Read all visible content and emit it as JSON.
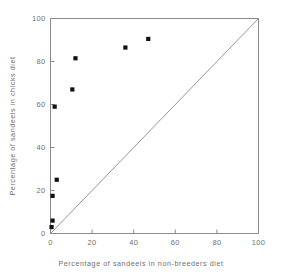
{
  "chart_data": {
    "type": "scatter",
    "title": "",
    "xlabel": "Percentage of sandeels in non-breeders diet",
    "ylabel": "Percentage of sandeels in chicks diet",
    "xlim": [
      0,
      100
    ],
    "ylim": [
      0,
      100
    ],
    "xticks": [
      0,
      20,
      40,
      60,
      80,
      100
    ],
    "yticks": [
      0,
      20,
      40,
      60,
      80,
      100
    ],
    "xticklabels": [
      "0",
      "20",
      "40",
      "60",
      "80",
      "100"
    ],
    "yticklabels": [
      "0",
      "20",
      "40",
      "60",
      "80",
      "100"
    ],
    "grid": false,
    "legend": "none",
    "marker_style": "filled-square",
    "marker_color": "#111111",
    "axis_color": "#8a8a8a",
    "points": [
      {
        "x": 0.5,
        "y": 3.0
      },
      {
        "x": 1.0,
        "y": 6.0
      },
      {
        "x": 1.0,
        "y": 17.5
      },
      {
        "x": 3.0,
        "y": 25.0
      },
      {
        "x": 2.0,
        "y": 59.0
      },
      {
        "x": 10.5,
        "y": 67.0
      },
      {
        "x": 12.0,
        "y": 81.5
      },
      {
        "x": 36.0,
        "y": 86.5
      },
      {
        "x": 47.0,
        "y": 90.5
      }
    ],
    "reference_line": {
      "name": "one-to-one-line",
      "from": [
        0,
        0
      ],
      "to": [
        100,
        100
      ]
    }
  }
}
